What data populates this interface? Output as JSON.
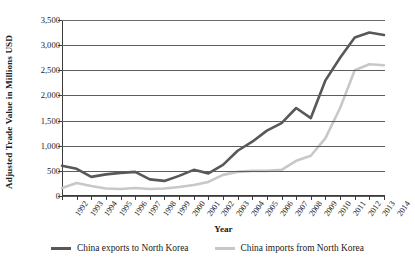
{
  "chart_data": {
    "type": "line",
    "title": "",
    "xlabel": "Year",
    "ylabel": "Adjusted Trade Value in Millions USD",
    "x": [
      1992,
      1993,
      1994,
      1995,
      1996,
      1997,
      1998,
      1999,
      2000,
      2001,
      2002,
      2003,
      2004,
      2005,
      2006,
      2007,
      2008,
      2009,
      2010,
      2011,
      2012,
      2013,
      2014
    ],
    "categories": [
      "1992",
      "1993",
      "1994",
      "1995",
      "1996",
      "1997",
      "1998",
      "1999",
      "2000",
      "2001",
      "2002",
      "2003",
      "2004",
      "2005",
      "2006",
      "2007",
      "2008",
      "2009",
      "2010",
      "2011",
      "2012",
      "2013",
      "2014"
    ],
    "xlim": [
      1992,
      2014
    ],
    "ylim": [
      0,
      3500
    ],
    "yticks": [
      0,
      500,
      1000,
      1500,
      2000,
      2500,
      3000,
      3500
    ],
    "ytick_labels": [
      "0",
      "500",
      "1,000",
      "1,500",
      "2,000",
      "2,500",
      "3,000",
      "3,500"
    ],
    "grid": true,
    "grid_axis": "y",
    "legend_position": "bottom",
    "series": [
      {
        "name": "China exports to North Korea",
        "color": "#585858",
        "values": [
          600,
          540,
          380,
          430,
          460,
          480,
          330,
          300,
          400,
          520,
          450,
          620,
          900,
          1080,
          1300,
          1450,
          1750,
          1550,
          2300,
          2750,
          3150,
          3250,
          3200
        ]
      },
      {
        "name": "China imports from North Korea",
        "color": "#c8c8c8",
        "values": [
          160,
          260,
          200,
          150,
          140,
          160,
          140,
          150,
          180,
          220,
          280,
          420,
          480,
          500,
          500,
          520,
          700,
          800,
          1150,
          1750,
          2500,
          2620,
          2600
        ]
      }
    ]
  },
  "legend": {
    "items": [
      {
        "label": "China exports to North Korea",
        "color": "#585858"
      },
      {
        "label": "China imports from North Korea",
        "color": "#c8c8c8"
      }
    ]
  },
  "axes": {
    "x_title": "Year",
    "y_title": "Adjusted Trade Value in Millions USD"
  }
}
